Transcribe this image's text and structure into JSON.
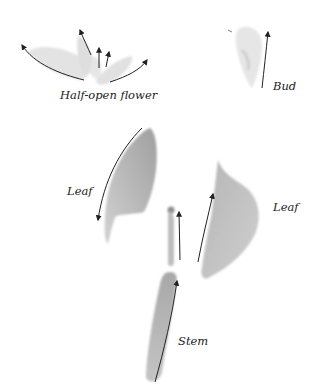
{
  "diagram": {
    "labels": {
      "flower": "Half-open flower",
      "bud": "Bud",
      "leaf_left": "Leaf",
      "leaf_right": "Leaf",
      "stem": "Stem"
    },
    "parts": [
      {
        "name": "half-open-flower",
        "arrows": 5
      },
      {
        "name": "bud",
        "arrows": 1
      },
      {
        "name": "leaf-left",
        "arrows": 1
      },
      {
        "name": "leaf-right",
        "arrows": 1
      },
      {
        "name": "stem-upper",
        "arrows": 1
      },
      {
        "name": "stem-lower",
        "arrows": 1
      }
    ],
    "colors": {
      "shape_fill_light": "#e4e4e4",
      "shape_fill_mid": "#c6c6c6",
      "shape_fill_dark": "#a9a9a9",
      "arrow": "#222222"
    }
  }
}
